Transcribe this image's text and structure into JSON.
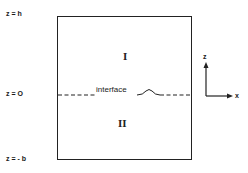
{
  "diagram": {
    "boundary_labels": {
      "top": "z = h",
      "interface": "z = O",
      "bottom": "z = - b"
    },
    "regions": {
      "upper": "I",
      "lower": "II"
    },
    "interface_label": "interface",
    "axes": {
      "vertical": "z",
      "horizontal": "x"
    },
    "colors": {
      "line": "#222222",
      "background": "#ffffff"
    }
  }
}
